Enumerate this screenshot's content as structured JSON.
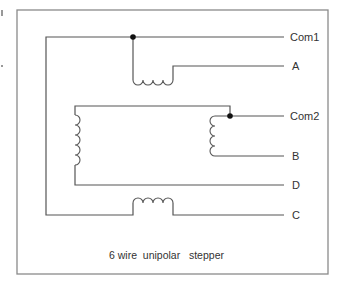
{
  "diagram": {
    "caption": "6 wire  unipolar   stepper",
    "terminals": {
      "com1": "Com1",
      "a": "A",
      "com2": "Com2",
      "b": "B",
      "d": "D",
      "c": "C"
    },
    "colors": {
      "wire": "#555555",
      "frame": "#8a8a8a",
      "junction": "#111111",
      "text": "#333333"
    }
  }
}
